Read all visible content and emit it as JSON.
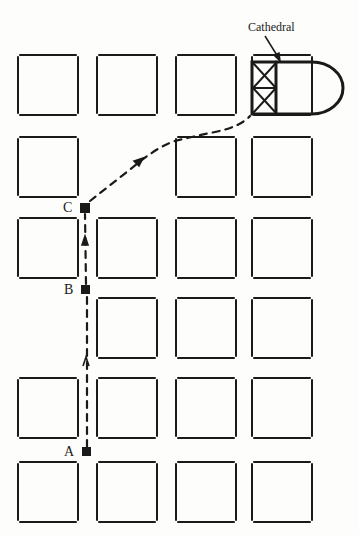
{
  "diagram": {
    "title": "",
    "colors": {
      "ink": "#1a1a1a",
      "background": "#fdfdfb"
    },
    "landmark": {
      "label": "Cathedral"
    },
    "points": [
      {
        "id": "A",
        "label": "A",
        "x": 87,
        "y": 452
      },
      {
        "id": "B",
        "label": "B",
        "x": 86,
        "y": 290
      },
      {
        "id": "C",
        "label": "C",
        "x": 84,
        "y": 208
      }
    ],
    "grid": {
      "columns_x": [
        18,
        97,
        176,
        252
      ],
      "rows_y": [
        55,
        137,
        218,
        298,
        378,
        462
      ],
      "block_w": 60,
      "block_h": 60,
      "missing_blocks": [
        [
          0,
          3
        ],
        [
          1,
          1
        ]
      ]
    },
    "route": {
      "style": "dashed",
      "direction": "A to B to C to Cathedral"
    }
  }
}
